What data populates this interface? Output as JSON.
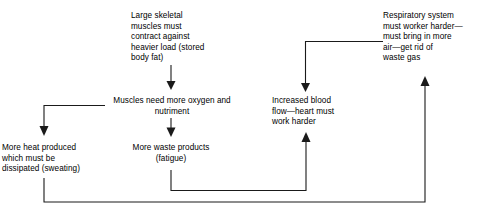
{
  "diagram": {
    "type": "flowchart",
    "background_color": "#ffffff",
    "line_color": "#1a1a1a",
    "text_color": "#000000",
    "nodes": [
      {
        "id": "skeletal-muscles",
        "text": "Large skeletal\nmuscles must\ncontract against\nheavier load (stored\nbody fat)",
        "align": "left",
        "x": 131,
        "y": 11,
        "width": 105
      },
      {
        "id": "respiratory-system",
        "text": "Respiratory system\nmust worker harder—\nmust bring in more\nair—get rid of\nwaste gas",
        "align": "left",
        "x": 383,
        "y": 11,
        "width": 98
      },
      {
        "id": "muscles-oxygen",
        "text": "Muscles need more oxygen and\nnutriment",
        "align": "center",
        "x": 102,
        "y": 96,
        "width": 140
      },
      {
        "id": "increased-blood-flow",
        "text": "Increased blood\nflow—heart must\nwork harder",
        "align": "left",
        "x": 272,
        "y": 96,
        "width": 90
      },
      {
        "id": "more-heat",
        "text": "More heat produced\nwhich must be\ndissipated (sweating)",
        "align": "left",
        "x": 2,
        "y": 143,
        "width": 100
      },
      {
        "id": "waste-products",
        "text": "More waste products\n(fatigue)",
        "align": "center",
        "x": 119,
        "y": 143,
        "width": 104
      }
    ],
    "connectors": [
      {
        "id": "skeletal-to-muscles",
        "from": "skeletal-muscles",
        "to": "muscles-oxygen",
        "style": "straight-down-arrow"
      },
      {
        "id": "muscles-to-heat",
        "from": "muscles-oxygen",
        "to": "more-heat",
        "style": "elbow-left-down-arrow"
      },
      {
        "id": "muscles-to-waste",
        "from": "muscles-oxygen",
        "to": "waste-products",
        "style": "straight-down-arrow"
      },
      {
        "id": "waste-to-blood-flow",
        "from": "waste-products",
        "to": "increased-blood-flow",
        "style": "down-right-up-arrow"
      },
      {
        "id": "respiratory-to-blood-flow",
        "from": "respiratory-system",
        "to": "increased-blood-flow",
        "style": "left-down-arrow"
      },
      {
        "id": "heat-to-respiratory",
        "from": "more-heat",
        "to": "respiratory-system",
        "style": "down-right-up-arrow"
      }
    ]
  }
}
